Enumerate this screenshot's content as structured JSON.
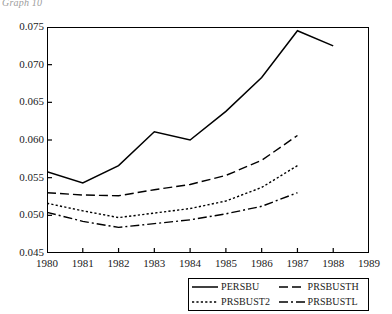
{
  "caption": "Graph 10",
  "chart_data": {
    "type": "line",
    "title": "",
    "subtitle": "",
    "xlabel": "",
    "ylabel": "",
    "x": [
      1980,
      1981,
      1982,
      1983,
      1984,
      1985,
      1986,
      1987,
      1988
    ],
    "xlim": [
      1980,
      1989
    ],
    "ylim": [
      0.045,
      0.075
    ],
    "xticks": [
      1980,
      1981,
      1982,
      1983,
      1984,
      1985,
      1986,
      1987,
      1988,
      1989
    ],
    "yticks": [
      0.045,
      0.05,
      0.055,
      0.06,
      0.065,
      0.07,
      0.075
    ],
    "ytick_labels": [
      "0.045",
      "0.050",
      "0.055",
      "0.060",
      "0.065",
      "0.070",
      "0.075"
    ],
    "xtick_labels": [
      "1980",
      "1981",
      "1982",
      "1983",
      "1984",
      "1985",
      "1986",
      "1987",
      "1988",
      "1989"
    ],
    "grid": false,
    "legend_position": "below-center",
    "series": [
      {
        "name": "PERSBU",
        "style": "solid",
        "x": [
          1980,
          1981,
          1982,
          1983,
          1984,
          1985,
          1986,
          1987,
          1988
        ],
        "values": [
          0.0558,
          0.0543,
          0.0566,
          0.0611,
          0.06,
          0.0638,
          0.0683,
          0.0745,
          0.0725
        ]
      },
      {
        "name": "PRSBUSTH",
        "style": "dashed",
        "x": [
          1980,
          1981,
          1982,
          1983,
          1984,
          1985,
          1986,
          1987
        ],
        "values": [
          0.053,
          0.0527,
          0.0526,
          0.0534,
          0.0541,
          0.0553,
          0.0573,
          0.0606
        ]
      },
      {
        "name": "PRSBUST2",
        "style": "dotted",
        "x": [
          1980,
          1981,
          1982,
          1983,
          1984,
          1985,
          1986,
          1987
        ],
        "values": [
          0.0516,
          0.0506,
          0.0497,
          0.0503,
          0.0509,
          0.0519,
          0.0537,
          0.0566
        ]
      },
      {
        "name": "PRSBUSTL",
        "style": "dashdot",
        "x": [
          1980,
          1981,
          1982,
          1983,
          1984,
          1985,
          1986,
          1987
        ],
        "values": [
          0.0504,
          0.0492,
          0.0484,
          0.0489,
          0.0494,
          0.0502,
          0.0512,
          0.053
        ]
      }
    ]
  },
  "legend": {
    "items": [
      {
        "label": "PERSBU",
        "style": "solid"
      },
      {
        "label": "PRSBUSTH",
        "style": "dashed"
      },
      {
        "label": "PRSBUST2",
        "style": "dotted"
      },
      {
        "label": "PRSBUSTL",
        "style": "dashdot"
      }
    ]
  },
  "colors": {
    "line": "#000000",
    "axis": "#000000",
    "background": "#ffffff",
    "caption": "#4a4a4a"
  }
}
